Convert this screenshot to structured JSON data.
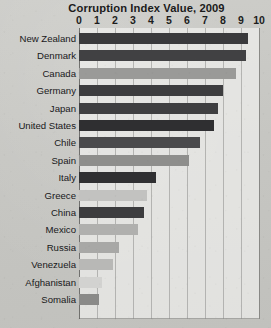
{
  "chart_data": {
    "type": "bar",
    "orientation": "horizontal",
    "title": "Corruption Index Value, 2009",
    "xlabel": "",
    "ylabel": "",
    "xlim": [
      0,
      10
    ],
    "xticks": [
      "0",
      "1",
      "2",
      "3",
      "4",
      "5",
      "6",
      "7",
      "8",
      "9",
      "10"
    ],
    "grid": "vertical",
    "legend": "none",
    "categories": [
      "New Zealand",
      "Denmark",
      "Canada",
      "Germany",
      "Japan",
      "United States",
      "Chile",
      "Spain",
      "Italy",
      "Greece",
      "China",
      "Mexico",
      "Russia",
      "Venezuela",
      "Afghanistan",
      "Somalia"
    ],
    "values": [
      9.4,
      9.3,
      8.7,
      8.0,
      7.7,
      7.5,
      6.7,
      6.1,
      4.3,
      3.8,
      3.6,
      3.3,
      2.2,
      1.9,
      1.3,
      1.1
    ],
    "bar_colors": [
      "#3a3a3c",
      "#414143",
      "#9a9a98",
      "#3d3d3f",
      "#3f3f41",
      "#2f2f31",
      "#4a4a4c",
      "#8e8e8c",
      "#303032",
      "#c2c2c0",
      "#3c3c3e",
      "#b0b0ae",
      "#a8a8a6",
      "#b8b8b6",
      "#d2d2d0",
      "#8a8a88"
    ]
  },
  "colors": {
    "paper": "#c9c9c5",
    "plot_background": "#f6f6f3",
    "gridline": "#8d8d8a",
    "axis": "#5c5c59",
    "text": "#1b1b1b"
  }
}
